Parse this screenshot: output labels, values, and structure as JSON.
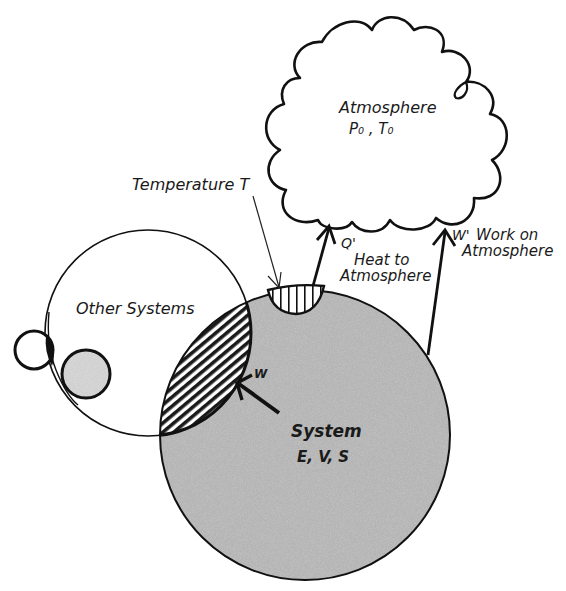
{
  "diagram": {
    "atmosphere": {
      "title": "Atmosphere",
      "properties": "P₀ , T₀"
    },
    "system": {
      "title": "System",
      "properties": "E, V, S"
    },
    "other_systems": {
      "label": "Other Systems"
    },
    "reservoir": {
      "label": "Temperature T"
    },
    "heat_flow": {
      "symbol": "Q'",
      "line1": "Heat to",
      "line2": "Atmosphere"
    },
    "work_flow": {
      "symbol": "W'",
      "line1": "Work on",
      "line2": "Atmosphere"
    },
    "work_other": {
      "symbol": "W"
    },
    "colors": {
      "ink": "#111111",
      "stipple": "#a8a8a8",
      "background": "#ffffff"
    }
  }
}
